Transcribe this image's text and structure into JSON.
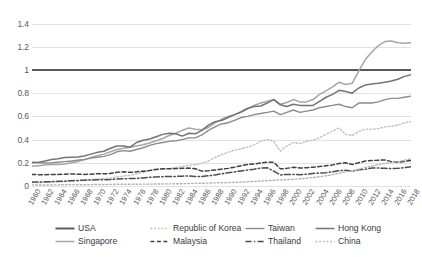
{
  "chart_data": {
    "type": "line",
    "title": "",
    "xlabel": "",
    "ylabel": "",
    "ylim": [
      0,
      1.5
    ],
    "xlim": [
      1960,
      2018
    ],
    "grid": true,
    "legend_position": "bottom",
    "yticks": [
      "0",
      "0.2",
      "0.4",
      "0.6",
      "0.8",
      "1",
      "1.2",
      "1.4"
    ],
    "ytick_values": [
      0,
      0.2,
      0.4,
      0.6,
      0.8,
      1.0,
      1.2,
      1.4
    ],
    "categories": [
      "1960",
      "1961",
      "1962",
      "1963",
      "1964",
      "1965",
      "1966",
      "1967",
      "1968",
      "1969",
      "1970",
      "1971",
      "1972",
      "1973",
      "1974",
      "1975",
      "1976",
      "1977",
      "1978",
      "1979",
      "1980",
      "1981",
      "1982",
      "1983",
      "1984",
      "1985",
      "1986",
      "1987",
      "1988",
      "1989",
      "1990",
      "1991",
      "1992",
      "1993",
      "1994",
      "1995",
      "1996",
      "1997",
      "1998",
      "1999",
      "2000",
      "2001",
      "2002",
      "2003",
      "2004",
      "2005",
      "2006",
      "2007",
      "2008",
      "2009",
      "2010",
      "2011",
      "2012",
      "2013",
      "2014",
      "2015",
      "2016",
      "2017",
      "2018"
    ],
    "xtick_labels": [
      "1960",
      "1962",
      "1964",
      "1966",
      "1968",
      "1970",
      "1972",
      "1974",
      "1976",
      "1978",
      "1980",
      "1982",
      "1984",
      "1986",
      "1988",
      "1990",
      "1992",
      "1994",
      "1996",
      "1998",
      "2000",
      "2002",
      "2004",
      "2006",
      "2008",
      "2010",
      "2012",
      "2014",
      "2016",
      "2018"
    ],
    "series": [
      {
        "name": "USA",
        "color": "#595959",
        "style": "solid",
        "width": 1.9,
        "values": [
          1,
          1,
          1,
          1,
          1,
          1,
          1,
          1,
          1,
          1,
          1,
          1,
          1,
          1,
          1,
          1,
          1,
          1,
          1,
          1,
          1,
          1,
          1,
          1,
          1,
          1,
          1,
          1,
          1,
          1,
          1,
          1,
          1,
          1,
          1,
          1,
          1,
          1,
          1,
          1,
          1,
          1,
          1,
          1,
          1,
          1,
          1,
          1,
          1,
          1,
          1,
          1,
          1,
          1,
          1,
          1,
          1,
          1,
          1
        ]
      },
      {
        "name": "Singapore",
        "color": "#a6a6a6",
        "style": "solid",
        "width": 1.5,
        "values": [
          0.17,
          0.175,
          0.18,
          0.185,
          0.185,
          0.19,
          0.2,
          0.21,
          0.225,
          0.245,
          0.26,
          0.275,
          0.295,
          0.315,
          0.325,
          0.335,
          0.345,
          0.355,
          0.37,
          0.39,
          0.41,
          0.435,
          0.455,
          0.48,
          0.5,
          0.49,
          0.485,
          0.505,
          0.545,
          0.575,
          0.6,
          0.615,
          0.635,
          0.665,
          0.695,
          0.715,
          0.73,
          0.745,
          0.705,
          0.72,
          0.745,
          0.725,
          0.725,
          0.745,
          0.79,
          0.82,
          0.855,
          0.895,
          0.875,
          0.885,
          0.99,
          1.09,
          1.155,
          1.21,
          1.245,
          1.25,
          1.235,
          1.23,
          1.235
        ]
      },
      {
        "name": "Republic of Korea",
        "color": "#bfbfbf",
        "style": "dotted",
        "width": 1.4,
        "values": [
          0.03,
          0.03,
          0.032,
          0.035,
          0.036,
          0.038,
          0.042,
          0.045,
          0.05,
          0.055,
          0.06,
          0.064,
          0.068,
          0.078,
          0.086,
          0.092,
          0.105,
          0.118,
          0.133,
          0.148,
          0.145,
          0.15,
          0.158,
          0.168,
          0.178,
          0.183,
          0.195,
          0.215,
          0.245,
          0.27,
          0.29,
          0.31,
          0.32,
          0.335,
          0.355,
          0.385,
          0.4,
          0.385,
          0.3,
          0.345,
          0.375,
          0.365,
          0.385,
          0.395,
          0.415,
          0.445,
          0.475,
          0.5,
          0.445,
          0.435,
          0.47,
          0.49,
          0.49,
          0.495,
          0.51,
          0.515,
          0.525,
          0.545,
          0.555
        ]
      },
      {
        "name": "Malaysia",
        "color": "#404040",
        "style": "dashed",
        "width": 1.5,
        "values": [
          0.1,
          0.098,
          0.098,
          0.1,
          0.1,
          0.102,
          0.103,
          0.102,
          0.1,
          0.102,
          0.105,
          0.105,
          0.108,
          0.118,
          0.122,
          0.118,
          0.122,
          0.128,
          0.133,
          0.142,
          0.148,
          0.148,
          0.15,
          0.152,
          0.155,
          0.148,
          0.128,
          0.132,
          0.138,
          0.145,
          0.152,
          0.162,
          0.175,
          0.185,
          0.19,
          0.198,
          0.205,
          0.205,
          0.148,
          0.152,
          0.162,
          0.155,
          0.158,
          0.162,
          0.168,
          0.175,
          0.182,
          0.195,
          0.2,
          0.185,
          0.2,
          0.215,
          0.22,
          0.222,
          0.225,
          0.21,
          0.205,
          0.212,
          0.22
        ]
      },
      {
        "name": "Taiwan",
        "color": "#8c8c8c",
        "style": "solid",
        "width": 1.4,
        "values": [
          0.205,
          0.2,
          0.198,
          0.2,
          0.205,
          0.21,
          0.215,
          0.222,
          0.23,
          0.24,
          0.248,
          0.255,
          0.27,
          0.295,
          0.305,
          0.3,
          0.315,
          0.33,
          0.35,
          0.365,
          0.375,
          0.385,
          0.39,
          0.4,
          0.415,
          0.415,
          0.44,
          0.48,
          0.51,
          0.535,
          0.545,
          0.565,
          0.59,
          0.6,
          0.615,
          0.625,
          0.635,
          0.645,
          0.615,
          0.635,
          0.655,
          0.635,
          0.645,
          0.655,
          0.675,
          0.685,
          0.695,
          0.705,
          0.685,
          0.675,
          0.715,
          0.715,
          0.715,
          0.725,
          0.745,
          0.755,
          0.755,
          0.765,
          0.775
        ]
      },
      {
        "name": "Thailand",
        "color": "#4d4d4d",
        "style": "dashdot",
        "width": 1.5,
        "values": [
          0.035,
          0.035,
          0.036,
          0.038,
          0.04,
          0.042,
          0.046,
          0.048,
          0.05,
          0.052,
          0.053,
          0.054,
          0.055,
          0.06,
          0.063,
          0.064,
          0.066,
          0.07,
          0.075,
          0.078,
          0.08,
          0.082,
          0.083,
          0.085,
          0.086,
          0.082,
          0.082,
          0.088,
          0.095,
          0.105,
          0.115,
          0.122,
          0.13,
          0.138,
          0.145,
          0.155,
          0.158,
          0.128,
          0.095,
          0.1,
          0.1,
          0.098,
          0.102,
          0.108,
          0.112,
          0.115,
          0.122,
          0.133,
          0.135,
          0.128,
          0.14,
          0.145,
          0.155,
          0.155,
          0.152,
          0.15,
          0.152,
          0.158,
          0.165
        ]
      },
      {
        "name": "Hong Kong",
        "color": "#737373",
        "style": "solid",
        "width": 1.5,
        "values": [
          0.2,
          0.205,
          0.215,
          0.228,
          0.235,
          0.245,
          0.248,
          0.25,
          0.258,
          0.275,
          0.29,
          0.3,
          0.325,
          0.345,
          0.345,
          0.335,
          0.375,
          0.395,
          0.405,
          0.425,
          0.445,
          0.455,
          0.45,
          0.43,
          0.455,
          0.45,
          0.48,
          0.525,
          0.555,
          0.565,
          0.59,
          0.615,
          0.64,
          0.67,
          0.685,
          0.69,
          0.715,
          0.745,
          0.7,
          0.685,
          0.705,
          0.695,
          0.695,
          0.695,
          0.73,
          0.765,
          0.79,
          0.825,
          0.815,
          0.8,
          0.845,
          0.87,
          0.88,
          0.885,
          0.895,
          0.905,
          0.92,
          0.945,
          0.96
        ]
      },
      {
        "name": "China",
        "color": "#b3b3b3",
        "style": "dotted",
        "width": 1.4,
        "values": [
          0.01,
          0.008,
          0.008,
          0.009,
          0.01,
          0.011,
          0.012,
          0.011,
          0.011,
          0.012,
          0.013,
          0.013,
          0.014,
          0.015,
          0.015,
          0.015,
          0.015,
          0.016,
          0.016,
          0.017,
          0.018,
          0.018,
          0.019,
          0.02,
          0.022,
          0.023,
          0.024,
          0.025,
          0.027,
          0.028,
          0.029,
          0.031,
          0.034,
          0.037,
          0.04,
          0.043,
          0.046,
          0.049,
          0.052,
          0.055,
          0.058,
          0.062,
          0.067,
          0.073,
          0.08,
          0.088,
          0.098,
          0.112,
          0.122,
          0.132,
          0.145,
          0.16,
          0.172,
          0.185,
          0.195,
          0.202,
          0.21,
          0.222,
          0.235
        ]
      }
    ]
  },
  "legend": {
    "rows": [
      [
        {
          "name": "USA",
          "style": "solid",
          "color": "#595959",
          "width": 1.9
        },
        {
          "name": "Republic of Korea",
          "style": "dotted",
          "color": "#bfbfbf",
          "width": 1.4
        },
        {
          "name": "Taiwan",
          "style": "solid",
          "color": "#8c8c8c",
          "width": 1.4
        },
        {
          "name": "Hong Kong",
          "style": "solid",
          "color": "#737373",
          "width": 1.5
        }
      ],
      [
        {
          "name": "Singapore",
          "style": "solid",
          "color": "#a6a6a6",
          "width": 1.5
        },
        {
          "name": "Malaysia",
          "style": "dashed",
          "color": "#404040",
          "width": 1.5
        },
        {
          "name": "Thailand",
          "style": "dashdot",
          "color": "#4d4d4d",
          "width": 1.5
        },
        {
          "name": "China",
          "style": "dotted",
          "color": "#b3b3b3",
          "width": 1.4
        }
      ]
    ]
  }
}
